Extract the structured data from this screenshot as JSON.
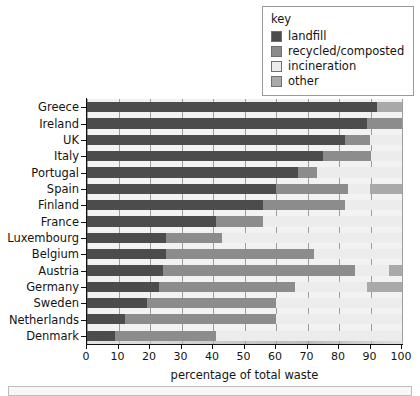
{
  "legend": {
    "title": "key",
    "items": [
      {
        "label": "landfill",
        "color": "#4c4c4c",
        "name": "landfill"
      },
      {
        "label": "recycled/composted",
        "color": "#8c8c8c",
        "name": "recycled"
      },
      {
        "label": "incineration",
        "color": "#ececec",
        "name": "incineration"
      },
      {
        "label": "other",
        "color": "#a9a9a9",
        "name": "other"
      }
    ]
  },
  "axis": {
    "xlabel": "percentage of total waste",
    "xticks": [
      "0",
      "10",
      "20",
      "30",
      "40",
      "50",
      "60",
      "70",
      "80",
      "90",
      "100"
    ],
    "xmin": 0,
    "xmax": 100
  },
  "chart_data": {
    "type": "bar",
    "orientation": "horizontal",
    "stacked": true,
    "title": "",
    "xlabel": "percentage of total waste",
    "ylabel": "",
    "xlim": [
      0,
      100
    ],
    "grid": true,
    "legend_position": "top-right",
    "categories": [
      "Greece",
      "Ireland",
      "UK",
      "Italy",
      "Portugal",
      "Spain",
      "Finland",
      "France",
      "Luxembourg",
      "Belgium",
      "Austria",
      "Germany",
      "Sweden",
      "Netherlands",
      "Denmark"
    ],
    "series": [
      {
        "name": "landfill",
        "color": "#4c4c4c",
        "values": [
          92,
          89,
          82,
          75,
          67,
          60,
          56,
          41,
          25,
          25,
          24,
          23,
          19,
          12,
          9
        ]
      },
      {
        "name": "recycled/composted",
        "color": "#8c8c8c",
        "values": [
          0,
          11,
          8,
          15,
          6,
          23,
          26,
          15,
          18,
          47,
          61,
          43,
          41,
          48,
          32
        ]
      },
      {
        "name": "incineration",
        "color": "#ececec",
        "values": [
          0,
          0,
          10,
          10,
          27,
          7,
          18,
          44,
          57,
          28,
          11,
          23,
          40,
          40,
          59
        ]
      },
      {
        "name": "other",
        "color": "#a9a9a9",
        "values": [
          8,
          0,
          0,
          0,
          0,
          10,
          0,
          0,
          0,
          0,
          4,
          11,
          0,
          0,
          0
        ]
      }
    ]
  }
}
